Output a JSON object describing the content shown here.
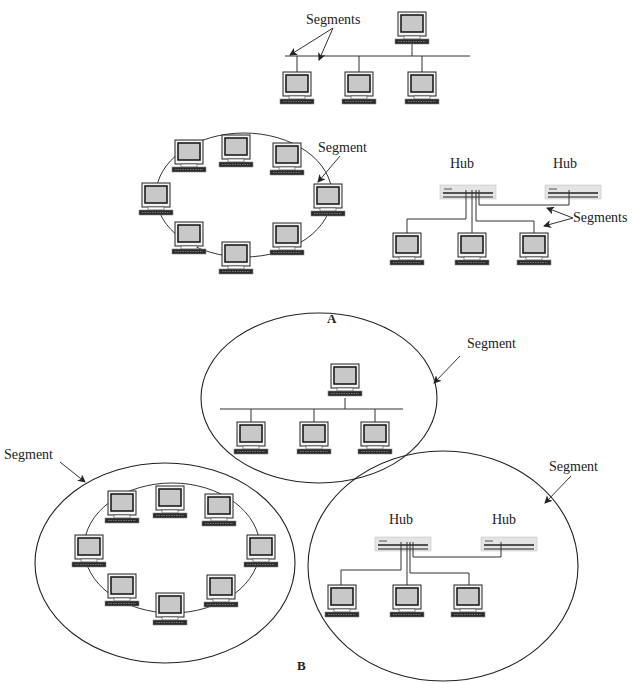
{
  "panel_a": {
    "label": "A",
    "bus": {
      "label": "Segments",
      "computers": 4
    },
    "ring": {
      "label": "Segment",
      "computers": 8
    },
    "star": {
      "hub_labels": [
        "Hub",
        "Hub"
      ],
      "label": "Segments",
      "computers": 3
    }
  },
  "panel_b": {
    "label": "B",
    "bus_segment_label": "Segment",
    "ring_segment_label": "Segment",
    "star_segment_label": "Segment",
    "hub_labels": [
      "Hub",
      "Hub"
    ]
  },
  "colors": {
    "screen": "#c8c8c8",
    "line": "#333333",
    "hub": "#e0e0e0"
  }
}
